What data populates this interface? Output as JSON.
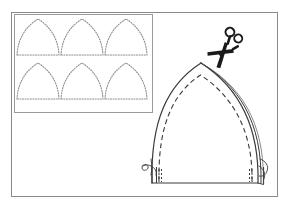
{
  "figure": {
    "caption": "",
    "background_color": "#ffffff",
    "line_color": "#3a3a3a",
    "dotted_color": "#8d8d8d",
    "frame_color": "#8a8a8a",
    "scissors_color": "#1a1a1a"
  },
  "outer_frame": {
    "name": "outer-frame",
    "x": 11,
    "y": 12,
    "width": 266,
    "height": 184,
    "stroke": "#8a8a8a",
    "stroke_width": 1
  },
  "inset_panel": {
    "name": "pattern-layout-inset",
    "x": 14,
    "y": 14,
    "width": 138,
    "height": 98,
    "stroke": "#9a9a9a",
    "stroke_width": 1,
    "description": "Cutting layout showing six dotted arch pieces arranged in two rows of three",
    "rows": 2,
    "columns": 3,
    "piece_count": 6,
    "pieces": [
      {
        "id": "piece-1",
        "row": 1,
        "col": 1,
        "cx": 38,
        "base_y": 55,
        "apex_y": 19,
        "half_width": 21
      },
      {
        "id": "piece-2",
        "row": 1,
        "col": 2,
        "cx": 82,
        "base_y": 55,
        "apex_y": 19,
        "half_width": 21
      },
      {
        "id": "piece-3",
        "row": 1,
        "col": 3,
        "cx": 126,
        "base_y": 55,
        "apex_y": 19,
        "half_width": 21
      },
      {
        "id": "piece-4",
        "row": 2,
        "col": 1,
        "cx": 38,
        "base_y": 99,
        "apex_y": 63,
        "half_width": 21
      },
      {
        "id": "piece-5",
        "row": 2,
        "col": 2,
        "cx": 82,
        "base_y": 99,
        "apex_y": 63,
        "half_width": 21
      },
      {
        "id": "piece-6",
        "row": 2,
        "col": 3,
        "cx": 126,
        "base_y": 99,
        "apex_y": 63,
        "half_width": 21
      }
    ]
  },
  "main_piece": {
    "name": "arch-fabric-piece",
    "description": "Large pointed arch fabric piece with layered cut edge, dashed seam allowance line and thread tails at lower corners",
    "apex_x": 201,
    "apex_y": 63,
    "base_y": 183,
    "left_base_x": 152,
    "right_base_x": 258,
    "outline_stroke": "#3a3a3a",
    "outline_stroke_width": 1.2,
    "seam_line_style": "dashed",
    "seam_dash_pattern": "5,3",
    "seam_stroke": "#3a3a3a",
    "layered_edge_side": "right",
    "layered_edge_line_count": 2
  },
  "thread_marks": {
    "name": "thread-tails",
    "description": "Small curled thread squiggles at the lower left and lower right of the arch piece",
    "left": {
      "x": 150,
      "y": 167
    },
    "right": {
      "x": 258,
      "y": 163
    },
    "count": 2
  },
  "scissors": {
    "name": "scissors-icon",
    "description": "Pair of scissors angled down-left, blades toward the arch apex, two ring handles at upper right",
    "x": 205,
    "y": 28,
    "width": 42,
    "height": 40,
    "rotation_deg": -36,
    "color": "#1a1a1a",
    "label": "scissors"
  },
  "corner_detail": {
    "name": "corner-notch-detail",
    "description": "Short dashed notch marks at the base corners of the arch piece",
    "dash_pattern": "2,2"
  }
}
